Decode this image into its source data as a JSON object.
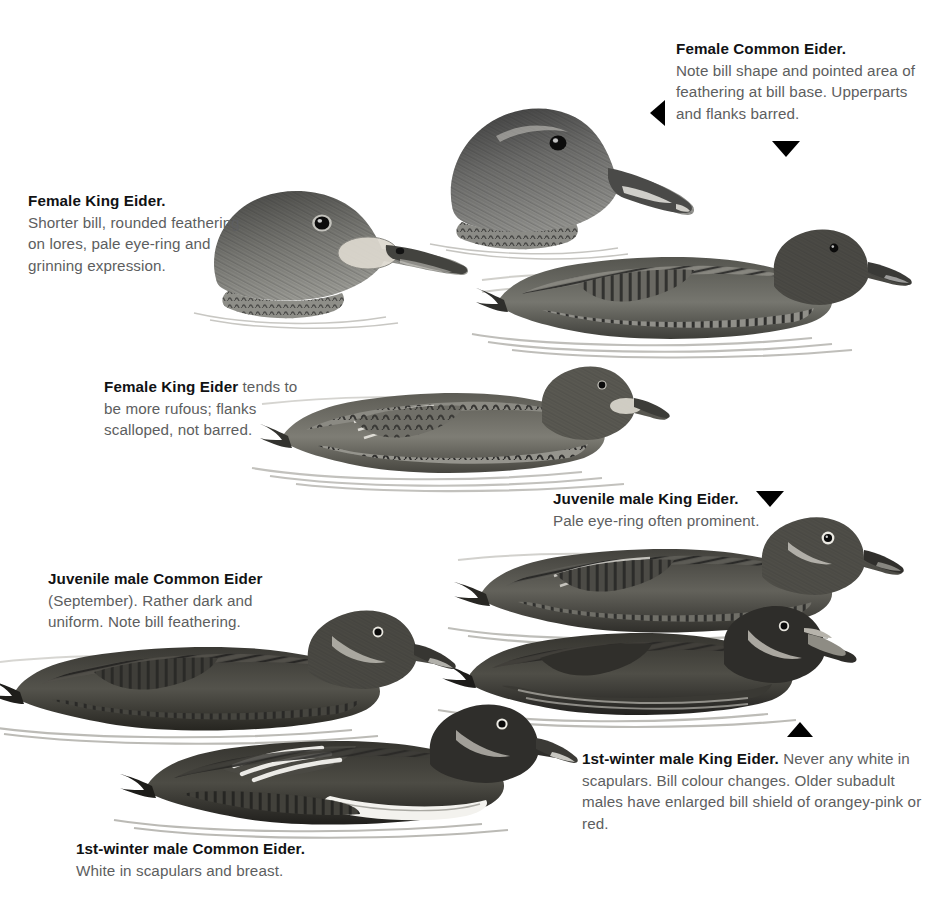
{
  "plate": {
    "title": "Eider identification plate",
    "background_color": "#ffffff",
    "heading_color": "#111214",
    "body_text_color": "#5d5e60"
  },
  "captions": [
    {
      "id": "female-common-eider",
      "heading": "Female Common Eider.",
      "body": "Note bill shape and pointed area of feathering at bill base. Upperparts and flanks barred.",
      "heading_inline": false
    },
    {
      "id": "female-king-eider",
      "heading": "Female King Eider.",
      "body": "Shorter bill, rounded feathering on lores, pale eye-ring and grinning expression.",
      "heading_inline": false
    },
    {
      "id": "female-king-eider-rufous",
      "heading": "Female King Eider",
      "body": " tends to be more rufous; flanks scalloped, not barred.",
      "heading_inline": true
    },
    {
      "id": "juvenile-male-king-eider",
      "heading": "Juvenile male King Eider.",
      "body": "Pale eye-ring often prominent.",
      "heading_inline": false
    },
    {
      "id": "juvenile-male-common-eider",
      "heading": "Juvenile male Common Eider",
      "body": "(September). Rather dark and uniform. Note bill feathering.",
      "heading_inline": false
    },
    {
      "id": "first-winter-male-king-eider",
      "heading": "1st-winter male King Eider.",
      "body": " Never any white in scapulars. Bill colour changes. Older subadult males have enlarged bill shield of orangey-pink or red.",
      "heading_inline": true
    },
    {
      "id": "first-winter-male-common-eider",
      "heading": "1st-winter male Common Eider.",
      "body": "White in scapulars and breast.",
      "heading_inline": false
    }
  ],
  "pointers": [
    {
      "id": "pointer-to-female-common-eider-head",
      "direction": "left"
    },
    {
      "id": "pointer-to-female-common-eider-body",
      "direction": "down"
    },
    {
      "id": "pointer-to-juvenile-male-king-eider",
      "direction": "down"
    },
    {
      "id": "pointer-to-first-winter-male-king-eider",
      "direction": "up"
    }
  ],
  "illustrations": [
    {
      "id": "female-common-eider-head",
      "subject": "Female Common Eider head"
    },
    {
      "id": "female-king-eider-head",
      "subject": "Female King Eider head"
    },
    {
      "id": "female-common-eider-swimming",
      "subject": "Female Common Eider swimming, barred flanks"
    },
    {
      "id": "female-king-eider-swimming",
      "subject": "Female King Eider swimming, scalloped flanks"
    },
    {
      "id": "juvenile-male-king-eider-swimming",
      "subject": "Juvenile male King Eider swimming"
    },
    {
      "id": "first-winter-male-king-eider-swimming",
      "subject": "1st-winter male King Eider swimming"
    },
    {
      "id": "juvenile-male-common-eider-swimming",
      "subject": "Juvenile male Common Eider swimming"
    },
    {
      "id": "first-winter-male-common-eider-swimming",
      "subject": "1st-winter male Common Eider swimming"
    }
  ]
}
